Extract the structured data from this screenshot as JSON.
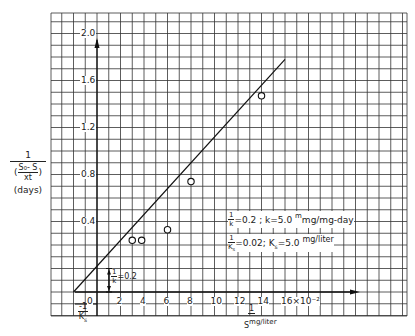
{
  "chart_data": {
    "type": "scatter",
    "title": "",
    "xlabel": "1/S mg/liter",
    "xlabel_numerator": "1",
    "xlabel_denominator": "S",
    "xlabel_units": "mg/liter",
    "ylabel_numerator": "1",
    "ylabel_denominator": "(S0 - S)/(Xt)",
    "ylabel_den_top": "S₀- S",
    "ylabel_den_bottom": "xt",
    "ylabel_units": "(days)",
    "x_ticks": [
      "0",
      "2",
      "4",
      "6",
      "8",
      "10",
      "12",
      "14",
      "16×10⁻²"
    ],
    "x_tick_values": [
      0,
      2,
      4,
      6,
      8,
      10,
      12,
      14,
      16
    ],
    "x_multiplier": "×10⁻²",
    "y_ticks": [
      "0.4",
      "0.8",
      "1.2",
      "1.6",
      "2.0"
    ],
    "y_tick_values": [
      0.4,
      0.8,
      1.2,
      1.6,
      2.0
    ],
    "xlim": [
      -4,
      26
    ],
    "ylim": [
      -0.2,
      2.4
    ],
    "grid": true,
    "legend": null,
    "series": [
      {
        "name": "observed",
        "marker": "open-circle",
        "points": [
          {
            "x": 3.0,
            "y": 0.44
          },
          {
            "x": 3.8,
            "y": 0.44
          },
          {
            "x": 6.0,
            "y": 0.53
          },
          {
            "x": 8.0,
            "y": 0.94
          },
          {
            "x": 14.0,
            "y": 1.67
          }
        ]
      },
      {
        "name": "fitted line",
        "type": "line",
        "points": [
          {
            "x": -2.0,
            "y": 0.0
          },
          {
            "x": 16.0,
            "y": 1.98
          }
        ]
      }
    ],
    "annotations": {
      "intercept_label_num": "1",
      "intercept_label_den": "k",
      "intercept_value": "=0.2",
      "x_intercept_num": "-1",
      "x_intercept_den": "K",
      "x_intercept_sub": "s",
      "result1_num": "1",
      "result1_den": "k",
      "result1_text": "=0.2 ; k=5.0",
      "result1_units": "mg/mg-day",
      "result1_units_sup": "m",
      "result2_num": "1",
      "result2_den": "K",
      "result2_den_sub": "s",
      "result2_text": "=0.02; K",
      "result2_sub": "s",
      "result2_value": "=5.0",
      "result2_units": "mg/liter"
    }
  }
}
